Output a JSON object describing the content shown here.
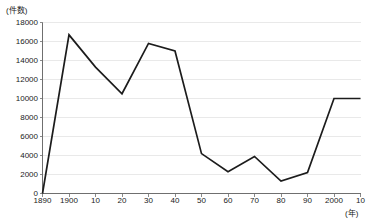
{
  "chart_data": {
    "type": "line",
    "title": "",
    "subtitle": "",
    "xlabel": "(年)",
    "ylabel": "(件数)",
    "x": [
      1890,
      1900,
      1910,
      1920,
      1930,
      1940,
      1950,
      1960,
      1970,
      1980,
      1990,
      2000,
      2010
    ],
    "values": [
      0,
      16700,
      13300,
      10500,
      15800,
      15000,
      4200,
      2300,
      3900,
      1300,
      2200,
      10000,
      10000
    ],
    "series": [
      {
        "name": "件数",
        "values": [
          0,
          16700,
          13300,
          10500,
          15800,
          15000,
          4200,
          2300,
          3900,
          1300,
          2200,
          10000,
          10000
        ]
      }
    ],
    "categories": [
      "1890",
      "1900",
      "10",
      "20",
      "30",
      "40",
      "50",
      "60",
      "70",
      "80",
      "90",
      "2000",
      "10"
    ],
    "xtick_labels": [
      "1890",
      "1900",
      "10",
      "20",
      "30",
      "40",
      "50",
      "60",
      "70",
      "80",
      "90",
      "2000",
      "10"
    ],
    "ytick_labels": [
      "0",
      "2000",
      "4000",
      "6000",
      "8000",
      "10000",
      "12000",
      "14000",
      "16000",
      "18000"
    ],
    "ytick_values": [
      0,
      2000,
      4000,
      6000,
      8000,
      10000,
      12000,
      14000,
      16000,
      18000
    ],
    "ylim": [
      0,
      18000
    ],
    "xlim": [
      1890,
      2010
    ],
    "grid": "horizontal",
    "legend": "none",
    "line_color": "#1c1c1c",
    "grid_color": "#e9e9e9",
    "axis_color": "#6f6f6f",
    "background_color": "#ffffff"
  },
  "axis_units": {
    "y_unit": "(件数)",
    "x_unit": "(年)"
  }
}
